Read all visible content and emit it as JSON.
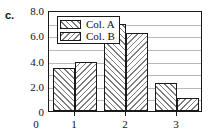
{
  "panel": {
    "label": "c."
  },
  "chart_data": {
    "type": "bar",
    "title": "",
    "xlabel": "",
    "ylabel": "",
    "categories": [
      "1",
      "2",
      "3"
    ],
    "series": [
      {
        "name": "Col. A",
        "pattern": "forward-hatch",
        "values": [
          3.4,
          6.9,
          2.25
        ]
      },
      {
        "name": "Col. B",
        "pattern": "backward-hatch",
        "values": [
          3.9,
          6.2,
          1.0
        ]
      }
    ],
    "ylim": [
      0,
      8.0
    ],
    "ytick_labels": [
      "0",
      "2.0",
      "4.0",
      "6.0",
      "8.0"
    ],
    "ytick_values": [
      0,
      2.0,
      4.0,
      6.0,
      8.0
    ],
    "yminor_values": [
      1.0,
      3.0,
      5.0,
      7.0
    ],
    "xtick_labels": [
      "0",
      "1",
      "2",
      "3"
    ],
    "grid": true,
    "legend_position": "top-left-inside",
    "colors": {
      "axis": "#1a1a1a",
      "gridline": "#b9b9b9",
      "hatch": "#7d7d7d",
      "bar_fill": "#ffffff",
      "text": "#111111"
    }
  }
}
